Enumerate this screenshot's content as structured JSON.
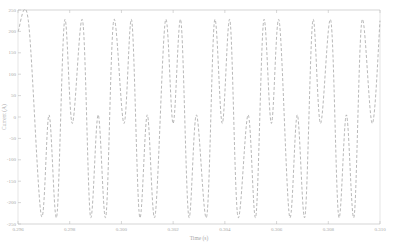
{
  "chart_data": {
    "type": "line",
    "title": "",
    "xlabel": "Time (s)",
    "ylabel": "Current (A)",
    "xlim": [
      0.296,
      0.31
    ],
    "ylim": [
      -250,
      250
    ],
    "x_ticks": [
      "0.296",
      "0.298",
      "0.300",
      "0.302",
      "0.304",
      "0.306",
      "0.308",
      "0.310"
    ],
    "y_ticks": [
      "250",
      "200",
      "150",
      "100",
      "50",
      "0",
      "-50",
      "-100",
      "-150",
      "-200",
      "-250"
    ],
    "grid": false,
    "legend": null,
    "line_style": "dashed",
    "line_color": "#9a9a9a",
    "series": [
      {
        "name": "current",
        "description": "periodic double-hump waveform: two peaks ~+225 A separated by a shallow dip (~0 to -20 A), then two troughs ~-230 A separated by a short rise (~0 A)",
        "period_s": 0.0033,
        "peak_value": 225,
        "trough_value": -232,
        "inner_dip_value": -15,
        "inner_rise_value": 5,
        "x": [
          0.296,
          0.2964,
          0.2969,
          0.2972,
          0.2975,
          0.2978,
          0.2981,
          0.2985,
          0.2988,
          0.2991,
          0.2994,
          0.2997,
          0.3001,
          0.3004,
          0.3007,
          0.301,
          0.3013,
          0.3017,
          0.302,
          0.3023,
          0.3026,
          0.3029,
          0.3033,
          0.3036,
          0.3039,
          0.3042,
          0.3045,
          0.3049,
          0.3052,
          0.3055,
          0.3058,
          0.3061,
          0.3065,
          0.3068,
          0.3071,
          0.3074,
          0.3077,
          0.3081,
          0.3084,
          0.3087,
          0.309,
          0.3093,
          0.3097,
          0.31
        ],
        "y": [
          200,
          225,
          -230,
          5,
          -232,
          225,
          -15,
          225,
          -232,
          5,
          -232,
          225,
          -15,
          225,
          -232,
          5,
          -232,
          225,
          -15,
          225,
          -232,
          5,
          -232,
          225,
          -15,
          225,
          -232,
          5,
          -232,
          225,
          -15,
          225,
          -232,
          5,
          -232,
          225,
          -15,
          225,
          -232,
          5,
          -232,
          225,
          -15,
          225
        ]
      }
    ]
  }
}
